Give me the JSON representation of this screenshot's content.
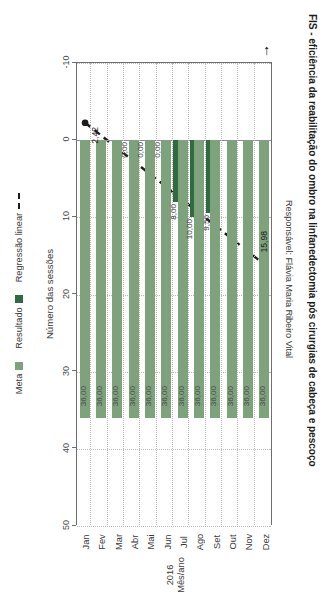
{
  "chart_data": {
    "type": "bar",
    "title": "FIS - eficiência da reabilitação do ombro na linfanedectomia pós cirurgias de cabeça e pescoço",
    "subtitle": "Responsável: Flávia Maria Ribeiro Vital",
    "xlabel_line1": "2016",
    "xlabel_line2": "Mês/ano",
    "ylabel": "Número das sessões",
    "categories": [
      "Jan",
      "Fev",
      "Mar",
      "Abr",
      "Mai",
      "Jun",
      "Jul",
      "Ago",
      "Set",
      "Out",
      "Nov",
      "Dez"
    ],
    "ylim": [
      -10,
      50
    ],
    "yticks": [
      "50",
      "40",
      "30",
      "20",
      "10",
      "0",
      "-10"
    ],
    "ytick_values": [
      50,
      40,
      30,
      20,
      10,
      0,
      -10
    ],
    "grid": true,
    "legend_position": "bottom",
    "series": [
      {
        "name": "Meta",
        "color": "#7ea37c",
        "values": [
          36.0,
          36.0,
          36.0,
          36.0,
          36.0,
          36.0,
          36.0,
          36.0,
          36.0,
          36.0,
          36.0,
          36.0
        ],
        "labels": [
          "36,00",
          "36,00",
          "36,00",
          "36,00",
          "36,00",
          "36,00",
          "36,00",
          "36,00",
          "36,00",
          "36,00",
          "36,00",
          "36,00"
        ]
      },
      {
        "name": "Resultado",
        "color": "#2f6b3f",
        "values": [
          0.0,
          0.0,
          0.0,
          0.0,
          0.0,
          0.0,
          8.0,
          10.0,
          9.5,
          0.0,
          0.0,
          0.0
        ],
        "labels": [
          "",
          "",
          "",
          "0,00",
          "0,00",
          "0,00",
          "8,00",
          "10,00",
          "9,50",
          "",
          "",
          ""
        ]
      },
      {
        "name": "Regressão linear",
        "color": "#1c1c1c",
        "style": "dashed",
        "endpoints": [
          {
            "category": "Jan",
            "value": -2.42,
            "label": "2,42"
          },
          {
            "category": "Dez",
            "value": 15.98,
            "label": "15,98"
          }
        ]
      }
    ],
    "annotations": [
      {
        "name": "target-arrow",
        "glyph": "→"
      }
    ]
  },
  "legend": {
    "items": [
      {
        "label": "Meta",
        "type": "swatch",
        "color": "#7ea37c"
      },
      {
        "label": "Resultado",
        "type": "swatch",
        "color": "#2f6b3f"
      },
      {
        "label": "Regressão linear",
        "type": "dash",
        "color": "#1c1c1c"
      }
    ]
  }
}
